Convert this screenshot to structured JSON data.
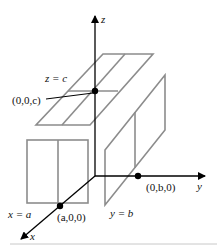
{
  "figure": {
    "axes": {
      "x_label": "x",
      "y_label": "y",
      "z_label": "z"
    },
    "planes": {
      "top": {
        "label": "z = c"
      },
      "left": {
        "label": "x = a"
      },
      "right": {
        "label": "y = b"
      }
    },
    "points": {
      "z_intercept": "(0,0,c)",
      "x_intercept": "(a,0,0)",
      "y_intercept": "(0,b,0)"
    },
    "colors": {
      "plane_stroke": "#8c8c8c",
      "axis_stroke": "#000000",
      "background": "#ffffff"
    }
  }
}
